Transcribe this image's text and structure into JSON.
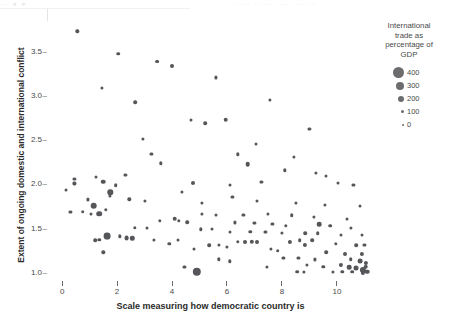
{
  "top_strip": {
    "visible_fragments": [
      {
        "text": "∙∙∙  ●  ●",
        "left": 2
      },
      {
        "text": "∙∙∙∙∙  ∙∙∙∙∙∙∙  ∙∙∙  ∙∙∙∙∙∙∙∙",
        "left": 236
      }
    ]
  },
  "axes": {
    "y_title": "Extent of ongoing domestic and international conflict",
    "x_title": "Scale measuring how democratic country is",
    "y_ticks": [
      "3.5",
      "3.0",
      "2.5",
      "2.0",
      "1.5",
      "1.0"
    ],
    "x_ticks": [
      "0",
      "2",
      "4",
      "6",
      "8",
      "10"
    ],
    "tick_dash": "–"
  },
  "legend": {
    "title": "International trade as percentage of GDP",
    "items": [
      {
        "label": "400",
        "size": 11
      },
      {
        "label": "300",
        "size": 8
      },
      {
        "label": "200",
        "size": 6
      },
      {
        "label": "100",
        "size": 3.2
      },
      {
        "label": "0",
        "size": 2
      }
    ]
  },
  "colors": {
    "point": "#555659",
    "legend_point": "#6c6c6f",
    "text": "#4a4a4a",
    "title_text": "#2b2b2b",
    "background": "#ffffff"
  },
  "chart_data": {
    "type": "scatter",
    "title": "",
    "xlabel": "Scale measuring how democratic country is",
    "ylabel": "Extent of ongoing domestic and international conflict",
    "xlim": [
      -0.55,
      11.35
    ],
    "ylim": [
      0.93,
      3.85
    ],
    "grid": false,
    "legend_position": "right",
    "size_encoding": {
      "name": "International trade as percentage of GDP",
      "breaks": [
        400,
        300,
        200,
        100,
        0
      ],
      "marker_px": [
        11,
        8,
        6,
        3.2,
        2
      ]
    },
    "point_fields": [
      "x",
      "y",
      "size_px"
    ],
    "points": [
      [
        0.55,
        3.72,
        3.4
      ],
      [
        2.05,
        3.47,
        3.6
      ],
      [
        3.45,
        3.38,
        3.8
      ],
      [
        4.0,
        3.33,
        4.0
      ],
      [
        5.6,
        3.2,
        3.2
      ],
      [
        1.45,
        3.08,
        3.2
      ],
      [
        7.55,
        2.95,
        3.2
      ],
      [
        2.65,
        2.92,
        3.6
      ],
      [
        5.95,
        2.72,
        4.6
      ],
      [
        4.7,
        2.72,
        3.0
      ],
      [
        5.2,
        2.68,
        3.6
      ],
      [
        9.0,
        2.62,
        3.2
      ],
      [
        2.95,
        2.5,
        3.2
      ],
      [
        7.05,
        2.45,
        3.0
      ],
      [
        6.4,
        2.33,
        3.4
      ],
      [
        3.25,
        2.33,
        3.2
      ],
      [
        3.6,
        2.23,
        3.4
      ],
      [
        8.45,
        2.3,
        3.2
      ],
      [
        6.75,
        2.22,
        4.6
      ],
      [
        8.1,
        2.15,
        3.4
      ],
      [
        9.25,
        2.12,
        3.2
      ],
      [
        2.3,
        2.1,
        3.2
      ],
      [
        9.6,
        2.08,
        3.0
      ],
      [
        1.25,
        2.07,
        3.0
      ],
      [
        0.45,
        2.05,
        3.2
      ],
      [
        0.45,
        2.0,
        3.2
      ],
      [
        1.5,
        2.02,
        4.6
      ],
      [
        6.1,
        1.98,
        3.0
      ],
      [
        4.75,
        2.0,
        4.0
      ],
      [
        1.95,
        1.98,
        3.6
      ],
      [
        7.25,
        2.02,
        3.2
      ],
      [
        10.05,
        2.0,
        3.0
      ],
      [
        10.6,
        1.98,
        3.2
      ],
      [
        0.15,
        1.93,
        3.0
      ],
      [
        1.75,
        1.9,
        5.4
      ],
      [
        1.75,
        1.86,
        3.2
      ],
      [
        0.95,
        1.82,
        3.2
      ],
      [
        2.45,
        1.82,
        3.4
      ],
      [
        3.0,
        1.8,
        3.2
      ],
      [
        4.35,
        1.9,
        3.2
      ],
      [
        5.1,
        1.78,
        3.2
      ],
      [
        6.2,
        1.85,
        3.2
      ],
      [
        7.1,
        1.8,
        3.0
      ],
      [
        8.5,
        1.78,
        3.2
      ],
      [
        9.55,
        1.76,
        3.2
      ],
      [
        10.85,
        1.74,
        3.0
      ],
      [
        1.15,
        1.75,
        6.6
      ],
      [
        1.6,
        1.7,
        3.4
      ],
      [
        0.3,
        1.68,
        3.2
      ],
      [
        0.75,
        1.68,
        3.6
      ],
      [
        1.05,
        1.66,
        3.0
      ],
      [
        1.35,
        1.66,
        5.6
      ],
      [
        5.1,
        1.66,
        3.2
      ],
      [
        5.6,
        1.64,
        3.0
      ],
      [
        6.6,
        1.64,
        3.2
      ],
      [
        7.5,
        1.66,
        3.2
      ],
      [
        8.35,
        1.64,
        3.6
      ],
      [
        9.15,
        1.62,
        3.2
      ],
      [
        10.35,
        1.6,
        3.0
      ],
      [
        3.55,
        1.58,
        3.4
      ],
      [
        4.1,
        1.6,
        4.6
      ],
      [
        4.25,
        1.58,
        3.4
      ],
      [
        4.55,
        1.56,
        3.6
      ],
      [
        6.3,
        1.56,
        3.2
      ],
      [
        7.0,
        1.55,
        3.2
      ],
      [
        7.65,
        1.54,
        3.2
      ],
      [
        8.15,
        1.52,
        3.4
      ],
      [
        9.35,
        1.54,
        4.6
      ],
      [
        9.75,
        1.52,
        3.6
      ],
      [
        10.5,
        1.5,
        3.2
      ],
      [
        2.65,
        1.5,
        3.4
      ],
      [
        3.1,
        1.5,
        3.0
      ],
      [
        5.05,
        1.48,
        3.4
      ],
      [
        5.45,
        1.48,
        3.0
      ],
      [
        6.1,
        1.45,
        3.0
      ],
      [
        6.85,
        1.45,
        3.4
      ],
      [
        7.4,
        1.45,
        3.2
      ],
      [
        8.0,
        1.44,
        3.2
      ],
      [
        8.85,
        1.44,
        3.6
      ],
      [
        9.3,
        1.44,
        3.6
      ],
      [
        10.15,
        1.42,
        3.0
      ],
      [
        10.9,
        1.42,
        3.0
      ],
      [
        1.65,
        1.4,
        6.8
      ],
      [
        2.1,
        1.4,
        3.4
      ],
      [
        2.35,
        1.38,
        4.8
      ],
      [
        2.55,
        1.38,
        4.4
      ],
      [
        1.2,
        1.36,
        3.6
      ],
      [
        1.35,
        1.36,
        3.4
      ],
      [
        3.35,
        1.36,
        3.2
      ],
      [
        4.2,
        1.36,
        3.0
      ],
      [
        6.4,
        1.34,
        3.4
      ],
      [
        6.65,
        1.34,
        4.0
      ],
      [
        6.9,
        1.34,
        4.4
      ],
      [
        7.1,
        1.34,
        4.0
      ],
      [
        8.3,
        1.34,
        4.2
      ],
      [
        8.65,
        1.36,
        3.6
      ],
      [
        8.85,
        1.3,
        4.2
      ],
      [
        9.1,
        1.36,
        3.6
      ],
      [
        9.95,
        1.32,
        3.4
      ],
      [
        10.7,
        1.3,
        3.6
      ],
      [
        11.0,
        1.3,
        3.2
      ],
      [
        5.35,
        1.3,
        3.6
      ],
      [
        5.7,
        1.3,
        3.2
      ],
      [
        6.0,
        1.28,
        3.2
      ],
      [
        3.9,
        1.32,
        3.4
      ],
      [
        1.5,
        1.22,
        3.4
      ],
      [
        4.8,
        1.26,
        3.0
      ],
      [
        7.6,
        1.26,
        3.2
      ],
      [
        7.85,
        1.24,
        3.6
      ],
      [
        9.6,
        1.22,
        3.6
      ],
      [
        10.3,
        1.2,
        4.0
      ],
      [
        10.9,
        1.2,
        4.2
      ],
      [
        8.05,
        1.16,
        3.2
      ],
      [
        8.6,
        1.16,
        3.2
      ],
      [
        9.2,
        1.14,
        3.2
      ],
      [
        5.7,
        1.14,
        3.4
      ],
      [
        6.1,
        1.12,
        3.4
      ],
      [
        10.5,
        1.14,
        3.6
      ],
      [
        10.85,
        1.12,
        4.8
      ],
      [
        11.05,
        1.1,
        4.2
      ],
      [
        4.45,
        1.06,
        3.2
      ],
      [
        7.45,
        1.06,
        3.2
      ],
      [
        8.9,
        1.08,
        3.2
      ],
      [
        9.5,
        1.06,
        3.4
      ],
      [
        10.15,
        1.08,
        4.2
      ],
      [
        10.45,
        1.05,
        4.6
      ],
      [
        10.7,
        1.04,
        5.0
      ],
      [
        10.95,
        1.02,
        6.2
      ],
      [
        11.05,
        1.06,
        4.6
      ],
      [
        4.9,
        1.0,
        8.4
      ],
      [
        8.55,
        1.0,
        3.6
      ],
      [
        8.8,
        1.0,
        3.2
      ],
      [
        9.85,
        1.0,
        3.2
      ],
      [
        10.2,
        1.0,
        3.4
      ],
      [
        10.55,
        1.0,
        3.6
      ],
      [
        10.95,
        0.99,
        4.2
      ],
      [
        11.1,
        1.0,
        4.6
      ]
    ]
  }
}
